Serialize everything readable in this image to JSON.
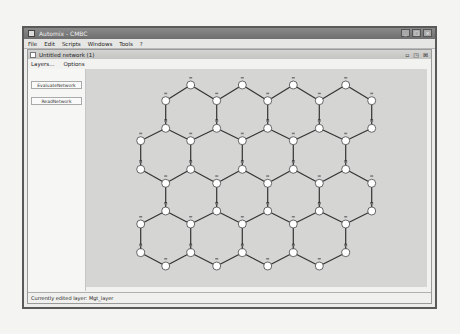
{
  "window": {
    "title": "Automix - CMBC",
    "controls": [
      "minimize",
      "maximize",
      "close"
    ]
  },
  "menubar": {
    "items": [
      "File",
      "Edit",
      "Scripts",
      "Windows",
      "Tools",
      "?"
    ]
  },
  "inner_frame": {
    "title": "Untitled network (1)",
    "controls": [
      "iconify",
      "maximize",
      "close"
    ],
    "submenu": [
      "Layers...",
      "Options"
    ]
  },
  "left_panel": {
    "buttons": [
      "EvaluateNetwork",
      "ReadNetwork"
    ]
  },
  "status": {
    "text": "Currently edited layer: Mgt_layer"
  },
  "network": {
    "node_color": "#ffffff",
    "edge_color": "#333333",
    "columns_x": [
      140.7,
      165.7,
      190.7,
      216.7,
      242.3,
      267.7,
      293.3,
      319.3,
      345.7,
      371.7
    ],
    "rows_y": [
      85,
      100.7,
      128.3,
      140.7,
      169.3,
      183.3,
      211,
      224,
      252.7,
      266
    ],
    "nodes": [
      [
        0,
        2
      ],
      [
        0,
        4
      ],
      [
        0,
        6
      ],
      [
        0,
        8
      ],
      [
        1,
        1
      ],
      [
        1,
        3
      ],
      [
        1,
        5
      ],
      [
        1,
        7
      ],
      [
        1,
        9
      ],
      [
        2,
        1
      ],
      [
        2,
        3
      ],
      [
        2,
        5
      ],
      [
        2,
        7
      ],
      [
        2,
        9
      ],
      [
        3,
        0
      ],
      [
        3,
        2
      ],
      [
        3,
        4
      ],
      [
        3,
        6
      ],
      [
        3,
        8
      ],
      [
        4,
        0
      ],
      [
        4,
        2
      ],
      [
        4,
        4
      ],
      [
        4,
        6
      ],
      [
        4,
        8
      ],
      [
        5,
        1
      ],
      [
        5,
        3
      ],
      [
        5,
        5
      ],
      [
        5,
        7
      ],
      [
        5,
        9
      ],
      [
        6,
        1
      ],
      [
        6,
        3
      ],
      [
        6,
        5
      ],
      [
        6,
        7
      ],
      [
        6,
        9
      ],
      [
        7,
        0
      ],
      [
        7,
        2
      ],
      [
        7,
        4
      ],
      [
        7,
        6
      ],
      [
        7,
        8
      ],
      [
        8,
        0
      ],
      [
        8,
        2
      ],
      [
        8,
        4
      ],
      [
        8,
        6
      ],
      [
        8,
        8
      ],
      [
        9,
        1
      ],
      [
        9,
        3
      ],
      [
        9,
        5
      ],
      [
        9,
        7
      ]
    ]
  }
}
